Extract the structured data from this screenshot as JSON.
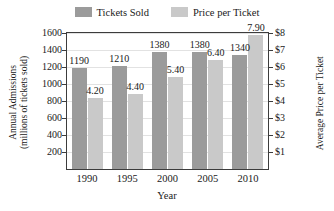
{
  "chart_data": {
    "type": "bar",
    "title": "",
    "xlabel": "Year",
    "categories": [
      "1990",
      "1995",
      "2000",
      "2005",
      "2010"
    ],
    "series": [
      {
        "name": "Tickets Sold",
        "axis": "left",
        "color": "#9b9b9b",
        "values": [
          1190,
          1210,
          1380,
          1380,
          1340
        ],
        "labels": [
          "1190",
          "1210",
          "1380",
          "1380",
          "1340"
        ]
      },
      {
        "name": "Price per Ticket",
        "axis": "right",
        "color": "#c9c9c9",
        "values": [
          4.2,
          4.4,
          5.4,
          6.4,
          7.9
        ],
        "labels": [
          "4.20",
          "4.40",
          "5.40",
          "6.40",
          "7.90"
        ]
      }
    ],
    "left_axis": {
      "title_line1": "Annual Admissions",
      "title_line2": "(millions of tickets sold)",
      "ticks": [
        "200",
        "400",
        "600",
        "800",
        "1000",
        "1200",
        "1400",
        "1600"
      ],
      "tick_values": [
        200,
        400,
        600,
        800,
        1000,
        1200,
        1400,
        1600
      ],
      "ylim": [
        0,
        1600
      ]
    },
    "right_axis": {
      "title": "Average Price per Ticket",
      "ticks": [
        "$1",
        "$2",
        "$3",
        "$4",
        "$5",
        "$6",
        "$7",
        "$8"
      ],
      "tick_values": [
        1,
        2,
        3,
        4,
        5,
        6,
        7,
        8
      ],
      "ylim": [
        0,
        8
      ]
    },
    "legend": {
      "position": "top-center",
      "entries": [
        {
          "label": "Tickets Sold",
          "color": "#9b9b9b"
        },
        {
          "label": "Price per Ticket",
          "color": "#c9c9c9"
        }
      ]
    },
    "grid": true
  }
}
